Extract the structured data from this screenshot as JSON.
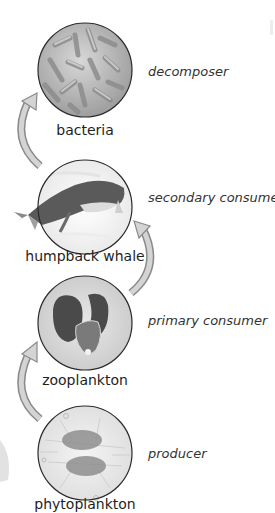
{
  "diagram": {
    "type": "food-chain",
    "organisms": [
      {
        "name": "bacteria",
        "role": "decomposer",
        "icon": "bacteria-icon"
      },
      {
        "name": "humpback whale",
        "role": "secondary consumer",
        "icon": "whale-icon"
      },
      {
        "name": "zooplankton",
        "role": "primary consumer",
        "icon": "zooplankton-icon"
      },
      {
        "name": "phytoplankton",
        "role": "producer",
        "icon": "phytoplankton-icon"
      }
    ],
    "arrows": [
      {
        "from": "phytoplankton",
        "to": "zooplankton",
        "side": "left"
      },
      {
        "from": "zooplankton",
        "to": "humpback whale",
        "side": "right"
      },
      {
        "from": "humpback whale",
        "to": "bacteria",
        "side": "left"
      }
    ],
    "colors": {
      "arrow_fill": "#d4d4d4",
      "arrow_stroke": "#8a8a8a",
      "circle_stroke": "#2a2a2a"
    }
  }
}
